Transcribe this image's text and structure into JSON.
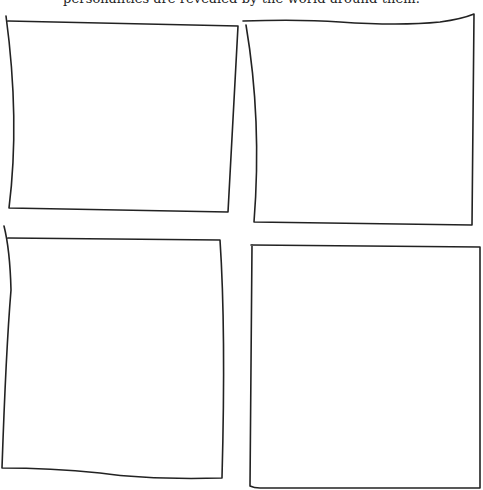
{
  "caption": "personalities are revealed by the world around them.",
  "panels": [
    {
      "id": "top-left",
      "content": ""
    },
    {
      "id": "top-right",
      "content": ""
    },
    {
      "id": "bottom-left",
      "content": ""
    },
    {
      "id": "bottom-right",
      "content": ""
    }
  ],
  "colors": {
    "ink": "#222222",
    "paper": "#ffffff"
  }
}
